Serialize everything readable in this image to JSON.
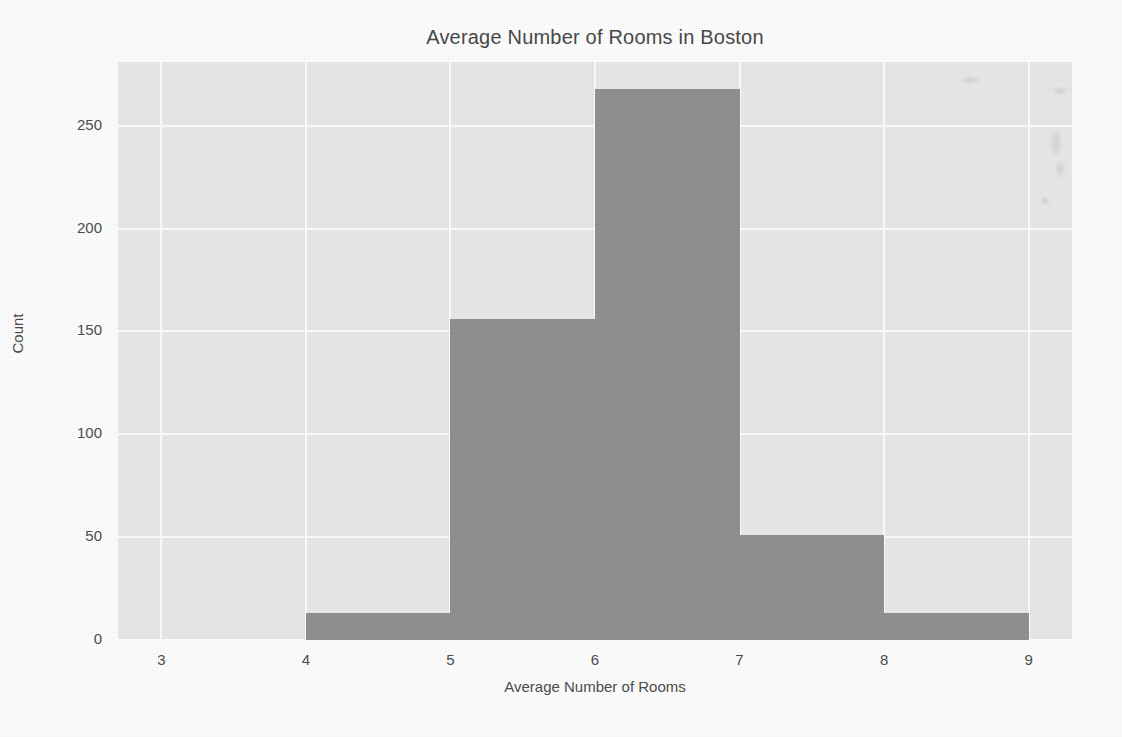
{
  "chart_data": {
    "type": "bar",
    "title": "Average Number of Rooms in Boston",
    "xlabel": "Average Number of Rooms",
    "ylabel": "Count",
    "grid": true,
    "legend": null,
    "xlim": [
      2.7,
      9.3
    ],
    "ylim": [
      0,
      281
    ],
    "xticks": [
      "3",
      "4",
      "5",
      "6",
      "7",
      "8",
      "9"
    ],
    "xtick_values": [
      3,
      4,
      5,
      6,
      7,
      8,
      9
    ],
    "yticks": [
      "0",
      "50",
      "100",
      "150",
      "200",
      "250"
    ],
    "ytick_values": [
      0,
      50,
      100,
      150,
      200,
      250
    ],
    "bin_edges": [
      3,
      4,
      5,
      6,
      7,
      8,
      9
    ],
    "categories": [
      "3-4",
      "4-5",
      "5-6",
      "6-7",
      "7-8",
      "8-9"
    ],
    "values": [
      0,
      13,
      156,
      268,
      51,
      13
    ],
    "bar_color": "#929292",
    "plot_background": "#eaeaea",
    "grid_color": "#ffffff",
    "figure_background": "#ffffff",
    "text_color": "#4e4e4e"
  },
  "artifacts": {
    "label": "scan-smudge",
    "spots": [
      {
        "x": 1052,
        "y": 86,
        "w": 16,
        "h": 10
      },
      {
        "x": 1049,
        "y": 128,
        "w": 14,
        "h": 30
      },
      {
        "x": 1054,
        "y": 160,
        "w": 12,
        "h": 18
      },
      {
        "x": 960,
        "y": 76,
        "w": 22,
        "h": 8
      },
      {
        "x": 1040,
        "y": 196,
        "w": 10,
        "h": 10
      }
    ]
  }
}
